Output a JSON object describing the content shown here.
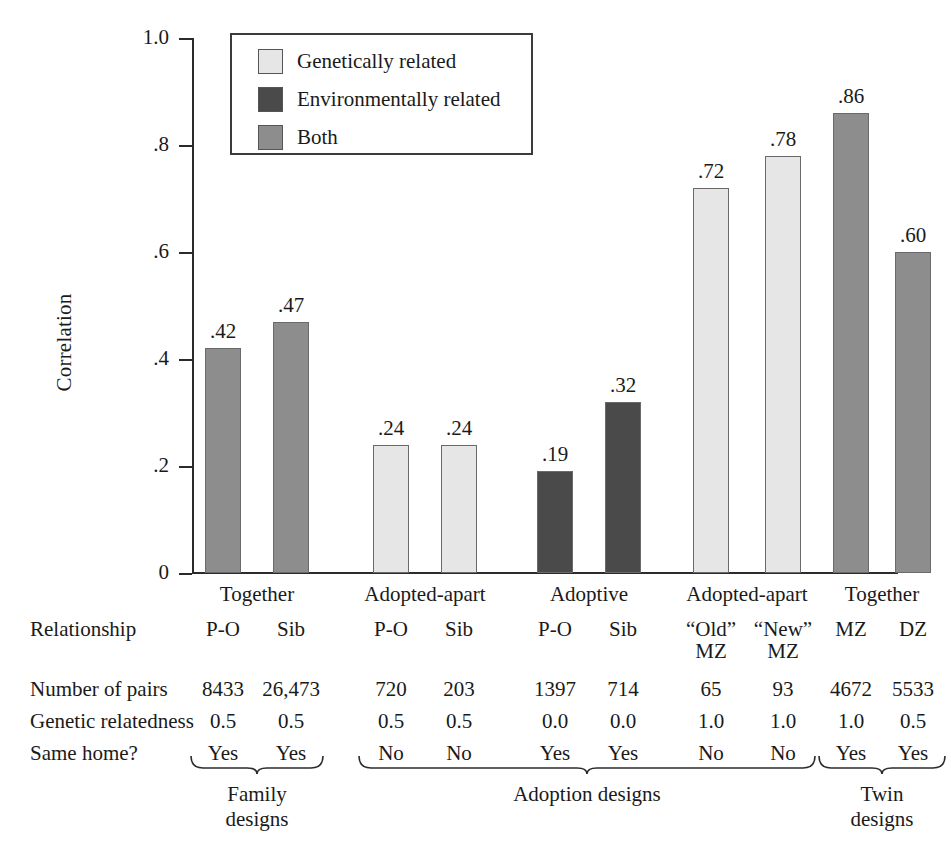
{
  "chart_data": {
    "type": "bar",
    "title": "",
    "xlabel": "",
    "ylabel": "Correlation",
    "ylim": [
      0,
      1.0
    ],
    "ytick_labels": [
      "0",
      ".2",
      ".4",
      ".6",
      ".8",
      "1.0"
    ],
    "ytick_values": [
      0,
      0.2,
      0.4,
      0.6,
      0.8,
      1.0
    ],
    "grid": false,
    "legend_position": "upper-left-inside",
    "legend": [
      {
        "label": "Genetically related",
        "color": "#e6e6e6"
      },
      {
        "label": "Environmentally related",
        "color": "#4a4a4a"
      },
      {
        "label": "Both",
        "color": "#8d8d8d"
      }
    ],
    "categories": [
      "Together P-O",
      "Together Sib",
      "Adopted-apart P-O",
      "Adopted-apart Sib",
      "Adoptive P-O",
      "Adoptive Sib",
      "Adopted-apart “Old” MZ",
      "Adopted-apart “New” MZ",
      "Together MZ",
      "Together DZ"
    ],
    "values": [
      0.42,
      0.47,
      0.24,
      0.24,
      0.19,
      0.32,
      0.72,
      0.78,
      0.86,
      0.6
    ],
    "value_labels": [
      ".42",
      ".47",
      ".24",
      ".24",
      ".19",
      ".32",
      ".72",
      ".78",
      ".86",
      ".60"
    ],
    "bar_series": [
      "Both",
      "Both",
      "Genetically related",
      "Genetically related",
      "Environmentally related",
      "Environmentally related",
      "Genetically related",
      "Genetically related",
      "Both",
      "Both"
    ]
  },
  "legend": {
    "items": [
      {
        "label": "Genetically related",
        "color": "#e6e6e6"
      },
      {
        "label": "Environmentally related",
        "color": "#4a4a4a"
      },
      {
        "label": "Both",
        "color": "#8d8d8d"
      }
    ]
  },
  "axis": {
    "y_title": "Correlation",
    "y_ticks": [
      "1.0",
      ".8",
      ".6",
      ".4",
      ".2",
      "0"
    ]
  },
  "condition_labels": [
    {
      "text": "Together",
      "span": [
        0,
        1
      ]
    },
    {
      "text": "Adopted-apart",
      "span": [
        2,
        3
      ]
    },
    {
      "text": "Adoptive",
      "span": [
        4,
        5
      ]
    },
    {
      "text": "Adopted-apart",
      "span": [
        6,
        7
      ]
    },
    {
      "text": "Together",
      "span": [
        8,
        9
      ]
    }
  ],
  "table": {
    "rows": [
      {
        "label": "Relationship",
        "values": [
          "P-O",
          "Sib",
          "P-O",
          "Sib",
          "P-O",
          "Sib",
          "“Old”",
          "“New”",
          "MZ",
          "DZ"
        ],
        "values_line2": [
          "",
          "",
          "",
          "",
          "",
          "",
          "MZ",
          "MZ",
          "",
          ""
        ]
      },
      {
        "label": "Number of pairs",
        "values": [
          "8433",
          "26,473",
          "720",
          "203",
          "1397",
          "714",
          "65",
          "93",
          "4672",
          "5533"
        ],
        "values_line2": [
          "",
          "",
          "",
          "",
          "",
          "",
          "",
          "",
          "",
          ""
        ]
      },
      {
        "label": "Genetic relatedness",
        "values": [
          "0.5",
          "0.5",
          "0.5",
          "0.5",
          "0.0",
          "0.0",
          "1.0",
          "1.0",
          "1.0",
          "0.5"
        ],
        "values_line2": [
          "",
          "",
          "",
          "",
          "",
          "",
          "",
          "",
          "",
          ""
        ]
      },
      {
        "label": "Same home?",
        "values": [
          "Yes",
          "Yes",
          "No",
          "No",
          "Yes",
          "Yes",
          "No",
          "No",
          "Yes",
          "Yes"
        ],
        "values_line2": [
          "",
          "",
          "",
          "",
          "",
          "",
          "",
          "",
          "",
          ""
        ]
      }
    ]
  },
  "brackets": [
    {
      "label_line1": "Family",
      "label_line2": "designs",
      "span": [
        0,
        1
      ]
    },
    {
      "label_line1": "Adoption designs",
      "label_line2": "",
      "span": [
        2,
        7
      ]
    },
    {
      "label_line1": "Twin",
      "label_line2": "designs",
      "span": [
        8,
        9
      ]
    }
  ],
  "colors": {
    "genetically_related": "#e6e6e6",
    "environmentally_related": "#4a4a4a",
    "both": "#8d8d8d",
    "axis": "#2b2b2b",
    "text": "#1a1a1a"
  }
}
